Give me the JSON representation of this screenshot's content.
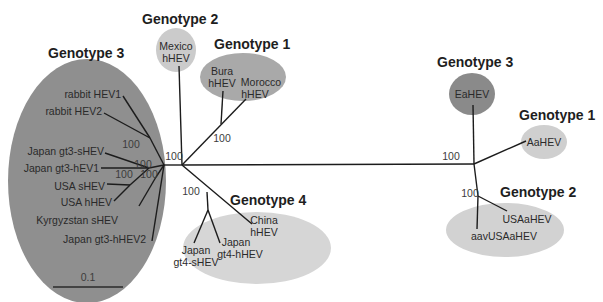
{
  "figure": {
    "type": "unrooted phylogenetic tree",
    "colors": {
      "dark_clade": "#8f8f8f",
      "light_clade": "#cfcfcf",
      "branch": "#1c1c1c",
      "text": "#2a2a2a"
    },
    "scale_bar": {
      "label": "0.1"
    },
    "clusters": {
      "human_gt3": {
        "title": "Genotype 3",
        "leaves": [
          "rabbit HEV1",
          "rabbit HEV2",
          "Japan gt3-sHEV",
          "Japan gt3-hEV1",
          "USA sHEV",
          "USA hHEV",
          "Kyrgyzstan sHEV",
          "Japan gt3-hHEV2"
        ]
      },
      "human_gt2": {
        "title": "Genotype 2",
        "leaves": [
          "Mexico",
          "hHEV"
        ]
      },
      "human_gt1": {
        "title": "Genotype 1",
        "leaves": [
          "Bura",
          "hHEV",
          "Morocco",
          "hHEV"
        ]
      },
      "human_gt4": {
        "title": "Genotype 4",
        "leaves": [
          "China",
          "hHEV",
          "Japan",
          "gt4-sHEV",
          "Japan",
          "gt4-hHEV"
        ]
      },
      "avian_gt3": {
        "title": "Genotype 3",
        "leaves": [
          "EaHEV"
        ]
      },
      "avian_gt1": {
        "title": "Genotype 1",
        "leaves": [
          "AaHEV"
        ]
      },
      "avian_gt2": {
        "title": "Genotype 2",
        "leaves": [
          "USAaHEV",
          "aavUSAaHEV"
        ]
      }
    },
    "bootstrap": {
      "gt3_rabbit": "100",
      "gt3_japan_s": "100",
      "gt3_usa": "100",
      "gt3_inner": "100",
      "root_left": "100",
      "gt1_node": "100",
      "gt4_node": "100",
      "avian_root": "100",
      "avian_gt2": "100"
    }
  }
}
